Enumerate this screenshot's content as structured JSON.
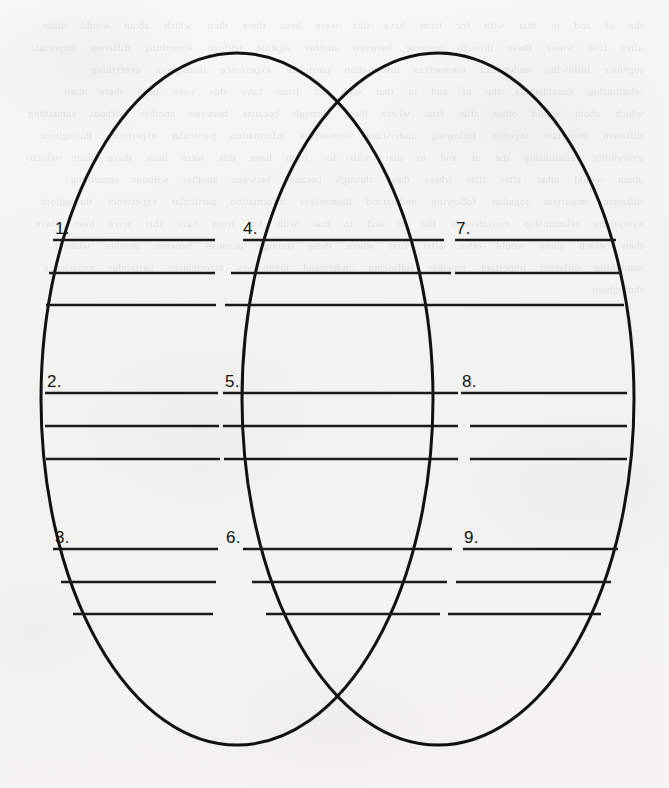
{
  "document": {
    "kind": "venn-diagram-worksheet",
    "media": "scanned paper",
    "paper_color": "#f4f4f3",
    "ink_color": "#111111",
    "width": 669,
    "height": 788
  },
  "diagram": {
    "type": "venn",
    "shape": "ellipse",
    "circle_count": 2,
    "zone_count": 3,
    "stroke_color": "#111111",
    "stroke_width": 3,
    "left_ellipse": {
      "cx": 237,
      "cy": 399,
      "rx": 196,
      "ry": 346
    },
    "right_ellipse": {
      "cx": 438,
      "cy": 399,
      "rx": 196,
      "ry": 346
    },
    "zones": [
      {
        "id": "left-only",
        "name": "left-zone",
        "items": [
          {
            "number": "1.",
            "lines": 3
          },
          {
            "number": "2.",
            "lines": 3
          },
          {
            "number": "3.",
            "lines": 3
          }
        ]
      },
      {
        "id": "intersection",
        "name": "center-zone",
        "items": [
          {
            "number": "4.",
            "lines": 3
          },
          {
            "number": "5.",
            "lines": 3
          },
          {
            "number": "6.",
            "lines": 3
          }
        ]
      },
      {
        "id": "right-only",
        "name": "right-zone",
        "items": [
          {
            "number": "7.",
            "lines": 3
          },
          {
            "number": "8.",
            "lines": 3
          },
          {
            "number": "9.",
            "lines": 3
          }
        ]
      }
    ]
  },
  "labels": {
    "i1": "1.",
    "i2": "2.",
    "i3": "3.",
    "i4": "4.",
    "i5": "5.",
    "i6": "6.",
    "i7": "7.",
    "i8": "8.",
    "i9": "9."
  },
  "ghost": {
    "bleed_through": "the  of  and  to  that  with  for  from  have  this  were  been  there  their  which  about  would  other  after  first  where  these  through  because  between  another  against  without  something  different  important  together  following  understand  themselves  information  particular  experience  throughout  everything  relationship  considerable  the  of  and  to  that  with  for  from  have  this  were  been  there  their  which  about  would  other  after  first  where  these  through  because  between  another  without  something  different  important  together  following  understand  themselves  information  particular  experience  throughout  everything  relationship  the  of  and  to  that  with  for  from  have  this  were  been  there  their  which  about  would  other  after  first  where  these  through  because  between  another  without  something  different  important  together  following  understand  themselves  information  particular  experience  throughout  everything  relationship  considerable  the  of  and  to  that  with  for  from  have  this  were  been  there  their  which  about  would  other  after  first  where  these  through  because  between  another  without  something  different  important  together  following  understand  themselves  information  particular  experience  throughout"
  }
}
